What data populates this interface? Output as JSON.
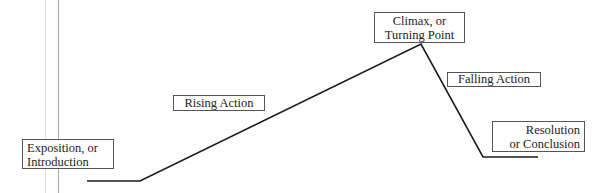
{
  "diagram": {
    "stages": [
      {
        "id": "exposition",
        "lines": [
          "Exposition, or",
          "Introduction"
        ]
      },
      {
        "id": "rising",
        "lines": [
          "Rising Action"
        ]
      },
      {
        "id": "climax",
        "lines": [
          "Climax, or",
          "Turning Point"
        ]
      },
      {
        "id": "falling",
        "lines": [
          "Falling Action"
        ]
      },
      {
        "id": "resolution",
        "lines": [
          "Resolution",
          "or Conclusion"
        ]
      }
    ],
    "plot_line_points": "87,181 140,181 421,44 483,157 538,157",
    "line_color": "#1a1a1a",
    "guide_line_colors": [
      "#dcdcdc",
      "#a8a8a8"
    ]
  }
}
